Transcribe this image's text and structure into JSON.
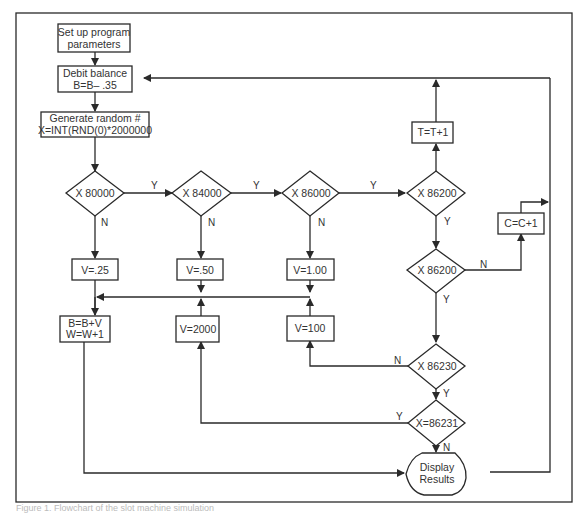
{
  "diagram": {
    "type": "flowchart",
    "nodes": {
      "setup": {
        "line1": "Set up program",
        "line2": "parameters"
      },
      "debit": {
        "line1": "Debit balance",
        "line2": "B=B– .35"
      },
      "random": {
        "line1": "Generate random #",
        "line2": "X=INT(RND(0)*2000000"
      },
      "d1": {
        "label": "X  80000"
      },
      "d2": {
        "label": "X  84000"
      },
      "d3": {
        "label": "X  86000"
      },
      "d4": {
        "label": "X  86200"
      },
      "d5": {
        "label": "X  86200"
      },
      "d6": {
        "label": "X  86230"
      },
      "d7": {
        "label": "X=86231"
      },
      "v25": {
        "label": "V=.25"
      },
      "v50": {
        "label": "V=.50"
      },
      "v100a": {
        "label": "V=1.00"
      },
      "v2000": {
        "label": "V=2000"
      },
      "v100": {
        "label": "V=100"
      },
      "bw": {
        "line1": "B=B+V",
        "line2": "W=W+1"
      },
      "tt": {
        "label": "T=T+1"
      },
      "cc": {
        "label": "C=C+1"
      },
      "display": {
        "line1": "Display",
        "line2": "Results"
      }
    },
    "edge_labels": {
      "d1_y": "Y",
      "d1_n": "N",
      "d2_y": "Y",
      "d2_n": "N",
      "d3_y": "Y",
      "d3_n": "N",
      "d4_y": "Y",
      "d5_n": "N",
      "d5_y": "Y",
      "d6_n": "N",
      "d6_y": "Y",
      "d7_y": "Y",
      "d7_n": "N"
    },
    "colors": {
      "line": "#2a2a2a",
      "background": "#ffffff"
    }
  },
  "caption": "Figure 1. Flowchart of the slot machine simulation"
}
